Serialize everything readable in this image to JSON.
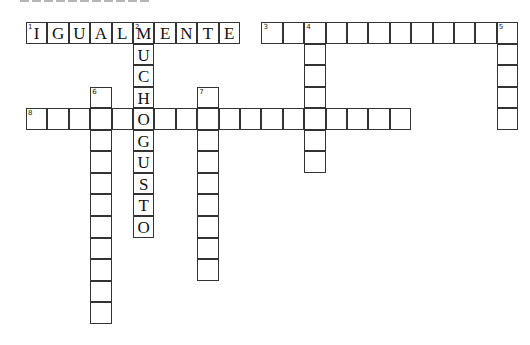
{
  "title": "",
  "grid": {
    "origin_x": 26,
    "origin_y": 22,
    "cell_w": 21.4,
    "cell_h": 21.55
  },
  "clues": [
    {
      "number": 1,
      "direction": "across",
      "row": 0,
      "col": 0,
      "length": 10,
      "answer": "IGUALMENTE"
    },
    {
      "number": 2,
      "direction": "down",
      "row": 0,
      "col": 5,
      "length": 10,
      "answer": "MUCHOGUSTO"
    },
    {
      "number": 3,
      "direction": "across",
      "row": 0,
      "col": 11,
      "length": 12,
      "answer": ""
    },
    {
      "number": 4,
      "direction": "down",
      "row": 0,
      "col": 13,
      "length": 7,
      "answer": ""
    },
    {
      "number": 5,
      "direction": "down",
      "row": 0,
      "col": 22,
      "length": 5,
      "answer": ""
    },
    {
      "number": 6,
      "direction": "down",
      "row": 3,
      "col": 3,
      "length": 11,
      "answer": ""
    },
    {
      "number": 7,
      "direction": "down",
      "row": 3,
      "col": 8,
      "length": 9,
      "answer": ""
    },
    {
      "number": 8,
      "direction": "across",
      "row": 4,
      "col": 0,
      "length": 18,
      "answer": ""
    }
  ]
}
